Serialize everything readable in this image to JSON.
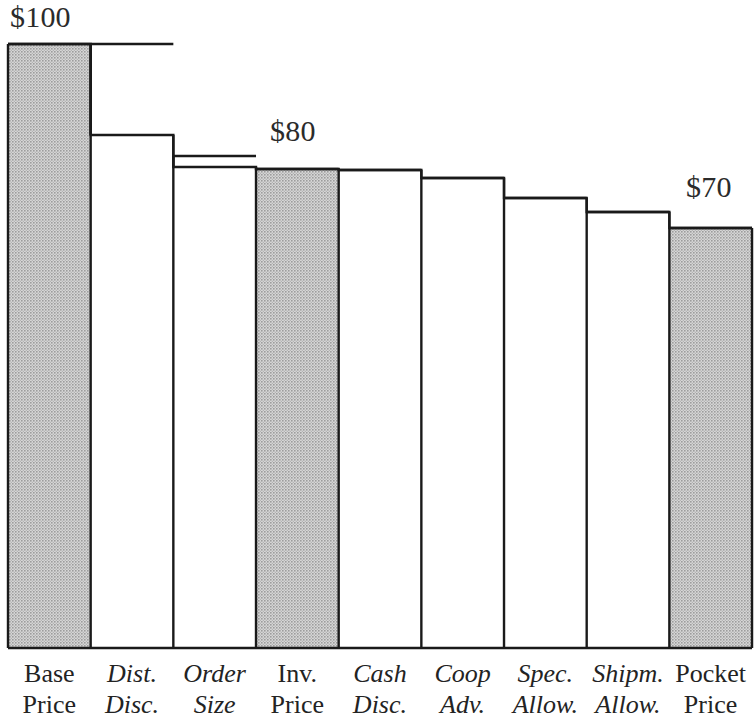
{
  "chart_data": {
    "type": "bar",
    "subtype": "waterfall",
    "title": "",
    "xlabel": "",
    "ylabel": "",
    "ylim": [
      0,
      104
    ],
    "grid": false,
    "legend": false,
    "currency": "$",
    "categories": [
      "Base Price",
      "Dist. Disc.",
      "Order Size",
      "Inv. Price",
      "Cash Disc.",
      "Coop Adv.",
      "Spec. Allow.",
      "Shipm. Allow.",
      "Pocket Price"
    ],
    "category_lines": [
      [
        "Base",
        "Price"
      ],
      [
        "Dist.",
        "Disc."
      ],
      [
        "Order",
        "Size"
      ],
      [
        "Inv.",
        "Price"
      ],
      [
        "Cash",
        "Disc."
      ],
      [
        "Coop",
        "Adv."
      ],
      [
        "Spec.",
        "Allow."
      ],
      [
        "Shipm.",
        "Allow."
      ],
      [
        "Pocket",
        "Price"
      ]
    ],
    "category_styles": [
      "upright",
      "italic",
      "italic",
      "upright",
      "italic",
      "italic",
      "italic",
      "italic",
      "upright"
    ],
    "bar_kinds": [
      "total",
      "decrement",
      "decrement",
      "total",
      "decrement",
      "decrement",
      "decrement",
      "decrement",
      "total"
    ],
    "cumulative_values": [
      100.0,
      100.0,
      84.9,
      80.0,
      79.7,
      78.5,
      75.7,
      73.5,
      70.0
    ],
    "step_top_values": [
      100.0,
      84.9,
      80.0,
      80.0,
      79.7,
      78.5,
      75.7,
      73.5,
      70.0
    ],
    "deltas": [
      100.0,
      -15.1,
      -4.9,
      0.0,
      -0.3,
      -1.2,
      -2.8,
      -2.2,
      0.0
    ],
    "values": [
      100.0,
      84.9,
      80.0,
      80.0,
      79.7,
      78.5,
      75.7,
      73.5,
      70.0
    ],
    "annotations": [
      {
        "text": "$100",
        "value": 100,
        "category": "Base Price",
        "x_px": 10,
        "y_px": 2
      },
      {
        "text": "$80",
        "value": 80,
        "category": "Inv. Price",
        "x_px": 270,
        "y_px": 116
      },
      {
        "text": "$70",
        "value": 70,
        "category": "Pocket Price",
        "x_px": 686,
        "y_px": 172
      }
    ],
    "geometry": {
      "plot_left_px": 8,
      "plot_right_px": 752,
      "baseline_y_px": 648,
      "col_width_px": 82.67,
      "step_top_y_px": [
        44,
        135,
        167,
        169,
        170,
        178,
        198,
        212,
        228
      ],
      "outline_box_top_y_px": [
        44,
        44,
        156,
        169,
        170,
        178,
        198,
        212,
        228
      ]
    },
    "colors": {
      "bar_fill_shaded": "#bdbdbd",
      "bar_fill_open": "#ffffff",
      "outline": "#1a1a1a",
      "text": "#232323",
      "background": "#ffffff"
    }
  },
  "annotation_labels": {
    "base": "$100",
    "invoice": "$80",
    "pocket": "$70"
  }
}
